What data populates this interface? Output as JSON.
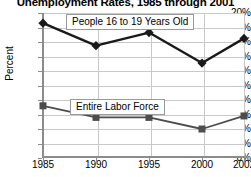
{
  "chart_data": {
    "type": "line",
    "title": "Unemployment Rates, 1985 through 2001",
    "xlabel": "",
    "ylabel": "Percent",
    "x": [
      1985,
      1990,
      1995,
      2000,
      2002
    ],
    "categories": [
      "1985",
      "1990",
      "1995",
      "2000",
      "2002"
    ],
    "xtick_labels": [
      "1985",
      "1990",
      "1995",
      "2000",
      "2002"
    ],
    "ytick_labels": [
      "20%",
      "18%",
      "16%",
      "14%",
      "12%",
      "10%",
      "8%",
      "6%",
      "4%",
      "2%",
      "0%"
    ],
    "ytick_values": [
      20,
      18,
      16,
      14,
      12,
      10,
      8,
      6,
      4,
      2,
      0
    ],
    "ylim": [
      0,
      20
    ],
    "grid": true,
    "legend_position": "inline-annotation",
    "series": [
      {
        "name": "People 16 to 19 Years Old",
        "values": [
          18.6,
          15.5,
          17.3,
          13.1,
          16.5
        ],
        "marker": "diamond",
        "color": "#1a1a1a"
      },
      {
        "name": "Entire Labor Force",
        "values": [
          7.2,
          5.6,
          5.6,
          4.0,
          5.8
        ],
        "marker": "square",
        "color": "#4d4d4d"
      }
    ],
    "annotations": [
      {
        "text": "People 16 to 19 Years Old"
      },
      {
        "text": "Entire Labor Force"
      }
    ]
  },
  "colors": {
    "series_teens": "#1a1a1a",
    "series_labor": "#4d4d4d",
    "grid": "#c9c9c9",
    "axis": "#8c8c8c",
    "text": "#000000",
    "background": "#ffffff"
  }
}
